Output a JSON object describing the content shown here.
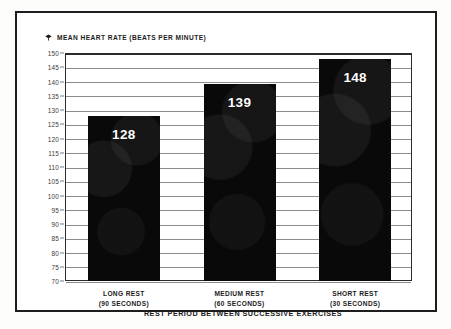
{
  "chart_data": {
    "type": "bar",
    "title": "MEAN HEART RATE (BEATS PER MINUTE)",
    "title_marker_icon": "diamond-marker-icon",
    "xlabel": "REST PERIOD BETWEEN SUCCESSIVE EXERCISES",
    "ylabel": "MEAN HEART RATE (BEATS PER MINUTE)",
    "categories": [
      "LONG REST",
      "MEDIUM REST",
      "SHORT REST"
    ],
    "category_sublabels": [
      "(90 SECONDS)",
      "(60 SECONDS)",
      "(30 SECONDS)"
    ],
    "values": [
      128,
      139,
      148
    ],
    "value_labels": [
      "128",
      "139",
      "148"
    ],
    "ylim": [
      70,
      150
    ],
    "ytick_step": 5,
    "ytick_labels": [
      "150",
      "145",
      "140",
      "135",
      "130",
      "125",
      "120",
      "115",
      "110",
      "105",
      "100",
      "95",
      "90",
      "85",
      "80",
      "75",
      "70"
    ],
    "grid": true,
    "legend": "none",
    "bar_color": "#090909",
    "grid_color": "#8c8c8c",
    "frame_color": "#1d1d1d",
    "value_label_color": "#ffffff"
  }
}
